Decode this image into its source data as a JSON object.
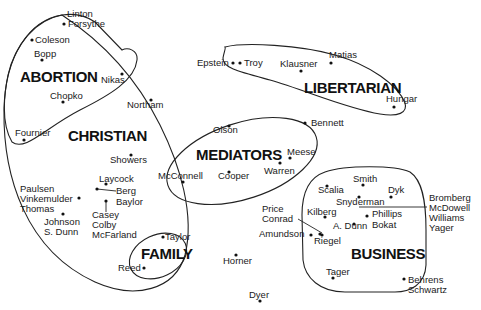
{
  "diagram": {
    "groups": [
      {
        "id": "abortion",
        "label": "ABORTION",
        "x": 20,
        "y": 82
      },
      {
        "id": "christian",
        "label": "CHRISTIAN",
        "x": 68,
        "y": 141
      },
      {
        "id": "libertarian",
        "label": "LIBERTARIAN",
        "x": 304,
        "y": 93
      },
      {
        "id": "mediators",
        "label": "MEDIATORS",
        "x": 196,
        "y": 160
      },
      {
        "id": "business",
        "label": "BUSINESS",
        "x": 351,
        "y": 259
      },
      {
        "id": "family",
        "label": "FAMILY",
        "x": 141,
        "y": 259
      }
    ],
    "people": [
      {
        "name": "Linton",
        "tx": 67,
        "ty": 17,
        "dx": null,
        "dy": null
      },
      {
        "name": "Forsythe",
        "tx": 68,
        "ty": 27,
        "dx": 64,
        "dy": 24
      },
      {
        "name": "Coleson",
        "tx": 35,
        "ty": 43,
        "dx": 32,
        "dy": 40
      },
      {
        "name": "Bopp",
        "tx": 34,
        "ty": 57,
        "dx": 42,
        "dy": 60
      },
      {
        "name": "Nikas",
        "tx": 101,
        "ty": 83,
        "dx": 122,
        "dy": 74
      },
      {
        "name": "Chopko",
        "tx": 50,
        "ty": 99,
        "dx": 63,
        "dy": 102
      },
      {
        "name": "Northam",
        "tx": 127,
        "ty": 108,
        "dx": 151,
        "dy": 100
      },
      {
        "name": "Fournier",
        "tx": 15,
        "ty": 136,
        "dx": 24,
        "dy": 140
      },
      {
        "name": "Showers",
        "tx": 110,
        "ty": 163,
        "dx": 131,
        "dy": 155
      },
      {
        "name": "Laycock",
        "tx": 99,
        "ty": 182,
        "dx": 106,
        "dy": 184
      },
      {
        "name": "Berg",
        "tx": 116,
        "ty": 194,
        "dx": 97,
        "dy": 189
      },
      {
        "name": "Baylor",
        "tx": 116,
        "ty": 205,
        "dx": null,
        "dy": null
      },
      {
        "name": "Paulsen",
        "tx": 20,
        "ty": 192,
        "dx": null,
        "dy": null
      },
      {
        "name": "Vinkemulder",
        "tx": 20,
        "ty": 202,
        "dx": 79,
        "dy": 198
      },
      {
        "name": "Thomas",
        "tx": 20,
        "ty": 212,
        "dx": null,
        "dy": null
      },
      {
        "name": "Johnson",
        "tx": 44,
        "ty": 225,
        "dx": 63,
        "dy": 214
      },
      {
        "name": "S. Dunn",
        "tx": 44,
        "ty": 235,
        "dx": null,
        "dy": null
      },
      {
        "name": "Casey",
        "tx": 92,
        "ty": 218,
        "dx": 106,
        "dy": 201
      },
      {
        "name": "Colby",
        "tx": 92,
        "ty": 228,
        "dx": null,
        "dy": null
      },
      {
        "name": "McFarland",
        "tx": 92,
        "ty": 238,
        "dx": null,
        "dy": null
      },
      {
        "name": "Taylor",
        "tx": 165,
        "ty": 240,
        "dx": 163,
        "dy": 237
      },
      {
        "name": "Reed",
        "tx": 118,
        "ty": 271,
        "dx": 144,
        "dy": 268
      },
      {
        "name": "Epstein",
        "tx": 197,
        "ty": 66,
        "dx": 233,
        "dy": 63
      },
      {
        "name": "Troy",
        "tx": 244,
        "ty": 66,
        "dx": 240,
        "dy": 63
      },
      {
        "name": "Klausner",
        "tx": 280,
        "ty": 67,
        "dx": 301,
        "dy": 71
      },
      {
        "name": "Matias",
        "tx": 329,
        "ty": 58,
        "dx": 331,
        "dy": 63
      },
      {
        "name": "Hungar",
        "tx": 386,
        "ty": 102,
        "dx": 394,
        "dy": 107
      },
      {
        "name": "Bennett",
        "tx": 311,
        "ty": 126,
        "dx": 305,
        "dy": 123
      },
      {
        "name": "Olson",
        "tx": 213,
        "ty": 133,
        "dx": 229,
        "dy": 126
      },
      {
        "name": "Meese",
        "tx": 287,
        "ty": 155,
        "dx": 290,
        "dy": 158
      },
      {
        "name": "Warren",
        "tx": 264,
        "ty": 174,
        "dx": 280,
        "dy": 163
      },
      {
        "name": "McConnell",
        "tx": 158,
        "ty": 179,
        "dx": 183,
        "dy": 182
      },
      {
        "name": "Cooper",
        "tx": 218,
        "ty": 179,
        "dx": 229,
        "dy": 172
      },
      {
        "name": "Smith",
        "tx": 353,
        "ty": 182,
        "dx": 363,
        "dy": 185
      },
      {
        "name": "Scalia",
        "tx": 318,
        "ty": 193,
        "dx": 327,
        "dy": 186
      },
      {
        "name": "Dyk",
        "tx": 388,
        "ty": 193,
        "dx": 391,
        "dy": 197
      },
      {
        "name": "Snyderman",
        "tx": 336,
        "ty": 205,
        "dx": 359,
        "dy": 197
      },
      {
        "name": "Price",
        "tx": 262,
        "ty": 212,
        "dx": null,
        "dy": null
      },
      {
        "name": "Conrad",
        "tx": 262,
        "ty": 222,
        "dx": 322,
        "dy": 235
      },
      {
        "name": "Kilberg",
        "tx": 307,
        "ty": 215,
        "dx": 325,
        "dy": 217
      },
      {
        "name": "Phillips",
        "tx": 372,
        "ty": 217,
        "dx": 367,
        "dy": 216
      },
      {
        "name": "Bokat",
        "tx": 372,
        "ty": 228,
        "dx": null,
        "dy": null
      },
      {
        "name": "A. Dunn",
        "tx": 333,
        "ty": 229,
        "dx": 354,
        "dy": 224
      },
      {
        "name": "Amundson",
        "tx": 259,
        "ty": 237,
        "dx": 311,
        "dy": 235
      },
      {
        "name": "Riegel",
        "tx": 314,
        "ty": 244,
        "dx": 320,
        "dy": 234
      },
      {
        "name": "Bromberg",
        "tx": 429,
        "ty": 201,
        "dx": null,
        "dy": null
      },
      {
        "name": "McDowell",
        "tx": 429,
        "ty": 211,
        "dx": null,
        "dy": null
      },
      {
        "name": "Williams",
        "tx": 429,
        "ty": 221,
        "dx": null,
        "dy": null
      },
      {
        "name": "Yager",
        "tx": 429,
        "ty": 231,
        "dx": null,
        "dy": null
      },
      {
        "name": "Horner",
        "tx": 223,
        "ty": 264,
        "dx": 236,
        "dy": 255
      },
      {
        "name": "Tager",
        "tx": 326,
        "ty": 275,
        "dx": 333,
        "dy": 278
      },
      {
        "name": "Behrens",
        "tx": 408,
        "ty": 283,
        "dx": 404,
        "dy": 279
      },
      {
        "name": "Schwartz",
        "tx": 408,
        "ty": 293,
        "dx": null,
        "dy": null
      },
      {
        "name": "Dyer",
        "tx": 249,
        "ty": 298,
        "dx": 260,
        "dy": 301
      }
    ]
  }
}
